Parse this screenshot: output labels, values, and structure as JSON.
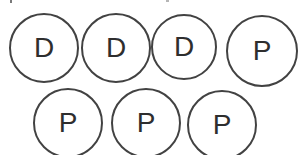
{
  "figure": {
    "colors": {
      "circle_stroke": "#424242",
      "letter": "#2e2e2e",
      "background": "#ffffff"
    },
    "rows": [
      {
        "items": [
          {
            "label": "D"
          },
          {
            "label": "D"
          },
          {
            "label": "D"
          },
          {
            "label": "P"
          }
        ]
      },
      {
        "items": [
          {
            "label": "P"
          },
          {
            "label": "P"
          },
          {
            "label": "P"
          }
        ]
      }
    ]
  }
}
